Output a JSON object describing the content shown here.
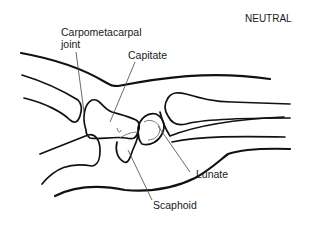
{
  "diagram": {
    "title": "NEUTRAL",
    "labels": {
      "carpometacarpal_joint": [
        "Carpometacarpal",
        "joint"
      ],
      "capitate": "Capitate",
      "lunate": "Lunate",
      "scaphoid": "Scaphoid"
    },
    "stroke_color": "#111111",
    "background": "#ffffff"
  }
}
